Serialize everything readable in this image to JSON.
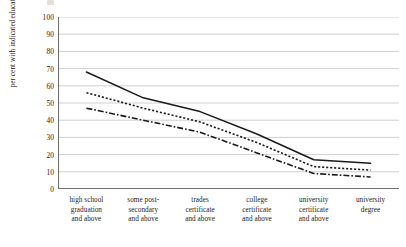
{
  "chart_data": {
    "type": "line",
    "title": "",
    "xlabel": "",
    "ylabel": "per cent with indicated education level or higher",
    "ylabel_lines": [
      "per cent with indicated",
      "education level or higher"
    ],
    "ylim": [
      0,
      100
    ],
    "y_ticks": [
      0,
      10,
      20,
      30,
      40,
      50,
      60,
      70,
      80,
      90,
      100
    ],
    "grid": true,
    "grid_axis": "y",
    "legend": "none",
    "categories": [
      "high school graduation and above",
      "some post-secondary and above",
      "trades certificate and above",
      "college certificate and above",
      "university certificate and above",
      "university degree"
    ],
    "category_lines": [
      [
        "high school",
        "graduation",
        "and above"
      ],
      [
        "some post-",
        "secondary",
        "and above"
      ],
      [
        "trades",
        "certificate",
        "and above"
      ],
      [
        "college",
        "certificate",
        "and above"
      ],
      [
        "university",
        "certificate",
        "and above"
      ],
      [
        "university",
        "degree"
      ]
    ],
    "series": [
      {
        "name": "series-solid",
        "style": "solid",
        "values": [
          68,
          53,
          45,
          32,
          17,
          15
        ]
      },
      {
        "name": "series-dotted",
        "style": "dotted",
        "values": [
          56,
          47,
          39,
          27,
          13,
          11
        ]
      },
      {
        "name": "series-dashdot",
        "style": "dashdot",
        "values": [
          47,
          40,
          33,
          21,
          9,
          7
        ]
      }
    ],
    "colors": {
      "line": "#1a1a1a",
      "grid": "#c4c4c4",
      "axis": "#6e6e6e",
      "text": "#1e1b19",
      "background": "#ffffff"
    }
  }
}
